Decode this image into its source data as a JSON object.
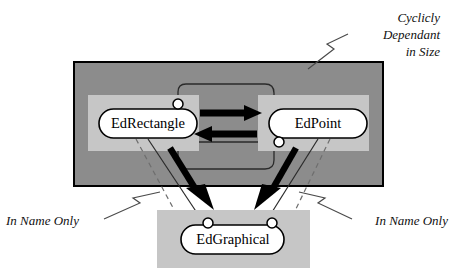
{
  "diagram": {
    "colors": {
      "background": "#ffffff",
      "outer_container_fill": "#8c8c8c",
      "inner_panel_fill": "#c6c6c6",
      "node_fill": "#ffffff",
      "stroke": "#000000",
      "thin_line": "#3a3a3a",
      "dashed_line": "#6e6e6e"
    },
    "containers": [
      {
        "name": "cyclic-group-container",
        "fill": "#8c8c8c",
        "x": 74,
        "y": 62,
        "width": 309,
        "height": 124
      },
      {
        "name": "edgraphical-panel",
        "fill": "#c6c6c6",
        "x": 157,
        "y": 210,
        "width": 153,
        "height": 58
      }
    ],
    "panels": [
      {
        "name": "edrectangle-panel",
        "fill": "#c6c6c6",
        "x": 88,
        "y": 95,
        "width": 111,
        "height": 56
      },
      {
        "name": "edpoint-panel",
        "fill": "#c6c6c6",
        "x": 258,
        "y": 95,
        "width": 111,
        "height": 56
      }
    ],
    "nodes": [
      {
        "id": "edrectangle",
        "label": "EdRectangle",
        "cx": 148,
        "cy": 123,
        "width": 98,
        "height": 29
      },
      {
        "id": "edpoint",
        "label": "EdPoint",
        "cx": 318,
        "cy": 123,
        "width": 98,
        "height": 29
      },
      {
        "id": "edgraphical",
        "label": "EdGraphical",
        "cx": 233,
        "cy": 239,
        "width": 103,
        "height": 29
      }
    ],
    "ports": [
      {
        "name": "edrectangle-top-port",
        "cx": 178,
        "cy": 104,
        "r": 5
      },
      {
        "name": "edpoint-bottom-port",
        "cx": 279,
        "cy": 142,
        "r": 5
      },
      {
        "name": "edgraphical-left-port",
        "cx": 208,
        "cy": 223,
        "r": 5
      },
      {
        "name": "edgraphical-right-port",
        "cx": 272,
        "cy": 223,
        "r": 5
      }
    ],
    "relations": [
      {
        "name": "edrectangle-to-edpoint",
        "type": "thick-arrow",
        "direction": "right"
      },
      {
        "name": "edpoint-to-edrectangle",
        "type": "thick-arrow",
        "direction": "left"
      },
      {
        "name": "edrectangle-to-edgraphical",
        "type": "thick-diagonal-arrow"
      },
      {
        "name": "edpoint-to-edgraphical",
        "type": "thick-diagonal-arrow"
      },
      {
        "name": "edrectangle-thin-link",
        "type": "thin-arrow"
      },
      {
        "name": "edpoint-thin-link",
        "type": "thin-arrow"
      },
      {
        "name": "edrectangle-dashed-link",
        "type": "dashed-line"
      },
      {
        "name": "edpoint-dashed-link",
        "type": "dashed-line"
      },
      {
        "name": "cycle-loop",
        "type": "rounded-loop"
      }
    ],
    "annotations": [
      {
        "id": "cyclic-note",
        "lines": [
          "Cyclicly",
          "Dependant",
          "in Size"
        ],
        "align": "right",
        "x": 440,
        "y": 22,
        "line_height": 17
      },
      {
        "id": "in-name-only-left",
        "lines": [
          "In Name Only"
        ],
        "align": "left",
        "x": 6,
        "y": 222,
        "line_height": 17
      },
      {
        "id": "in-name-only-right",
        "lines": [
          "In Name Only"
        ],
        "align": "end",
        "x": 448,
        "y": 222,
        "line_height": 17
      }
    ]
  }
}
